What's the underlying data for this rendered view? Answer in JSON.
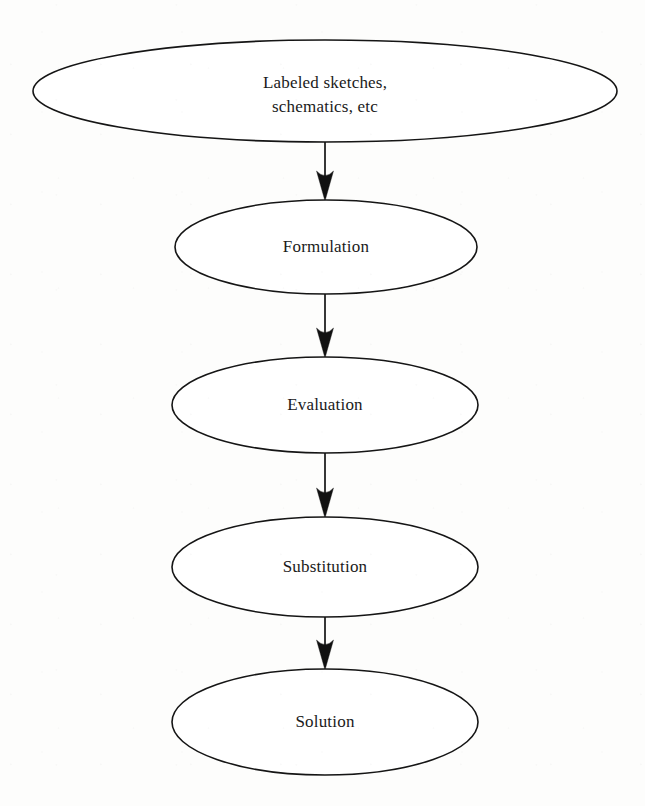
{
  "diagram": {
    "background_color": "#fdfdfc",
    "stroke_color": "#151515",
    "text_color": "#1a1a1a",
    "nodes": [
      {
        "id": "labeled-sketches",
        "label": "Labeled sketches, schematics, etc",
        "line1": "Labeled sketches,",
        "line2": "schematics, etc",
        "shape": "ellipse",
        "cx": 325,
        "cy": 91,
        "rx": 292,
        "ry": 51
      },
      {
        "id": "formulation",
        "label": "Formulation",
        "line1": "Formulation",
        "line2": "",
        "shape": "ellipse",
        "cx": 326,
        "cy": 247,
        "rx": 151,
        "ry": 47
      },
      {
        "id": "evaluation",
        "label": "Evaluation",
        "line1": "Evaluation",
        "line2": "",
        "shape": "ellipse",
        "cx": 325,
        "cy": 405,
        "rx": 153,
        "ry": 48
      },
      {
        "id": "substitution",
        "label": "Substitution",
        "line1": "Substitution",
        "line2": "",
        "shape": "ellipse",
        "cx": 325,
        "cy": 567,
        "rx": 153,
        "ry": 50
      },
      {
        "id": "solution",
        "label": "Solution",
        "line1": "Solution",
        "line2": "",
        "shape": "ellipse",
        "cx": 325,
        "cy": 722,
        "rx": 153,
        "ry": 53
      }
    ],
    "edges": [
      {
        "id": "edge-sketches-formulation",
        "from": "labeled-sketches",
        "to": "formulation",
        "direction": "down",
        "x": 325,
        "y_start": 142,
        "y_end": 200
      },
      {
        "id": "edge-formulation-evaluation",
        "from": "formulation",
        "to": "evaluation",
        "direction": "down",
        "x": 325,
        "y_start": 294,
        "y_end": 357
      },
      {
        "id": "edge-evaluation-substitution",
        "from": "evaluation",
        "to": "substitution",
        "direction": "down",
        "x": 325,
        "y_start": 453,
        "y_end": 517
      },
      {
        "id": "edge-substitution-solution",
        "from": "substitution",
        "to": "solution",
        "direction": "down",
        "x": 325,
        "y_start": 617,
        "y_end": 669
      }
    ]
  }
}
